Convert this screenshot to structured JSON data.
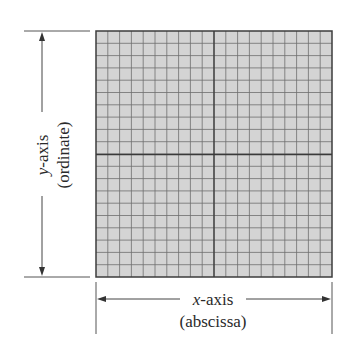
{
  "diagram": {
    "type": "coordinate-plane",
    "grid": {
      "columns": 20,
      "rows": 20,
      "fill_color": "#d4d4d4",
      "line_color": "#6f6f6f",
      "axis_line_color": "#3a3a3a",
      "border_color": "#3c3c3c"
    },
    "x_axis": {
      "label_var": "x",
      "label_suffix": "-axis",
      "sublabel": "(abscissa)"
    },
    "y_axis": {
      "label_var": "y",
      "label_suffix": "-axis",
      "sublabel": "(ordinate)"
    }
  }
}
